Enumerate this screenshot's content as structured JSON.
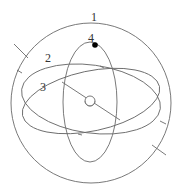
{
  "diagram": {
    "type": "gimbal / armillary sphere schematic",
    "labels": [
      {
        "id": "1",
        "text": "1",
        "target": "outer-sphere"
      },
      {
        "id": "2",
        "text": "2",
        "target": "tilted-ellipse-ring-2"
      },
      {
        "id": "3",
        "text": "3",
        "target": "tilted-ellipse-ring-3"
      },
      {
        "id": "4",
        "text": "4",
        "target": "vertical-ellipse-ring-4"
      }
    ],
    "colors": {
      "stroke": "#6a6a6a",
      "dot": "#000000",
      "label": "#333333",
      "background": "#ffffff"
    }
  }
}
